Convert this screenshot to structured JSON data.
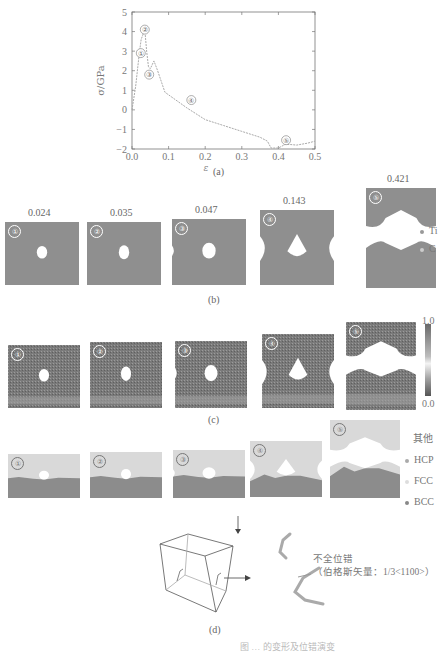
{
  "figure": {
    "panel_a": {
      "caption": "(a)"
    },
    "panel_b": {
      "caption": "(b)",
      "strains": [
        "0.024",
        "0.035",
        "0.047",
        "0.143",
        "0.421"
      ],
      "labels": [
        "①",
        "②",
        "③",
        "④",
        "⑤"
      ],
      "legend": [
        {
          "label": "Ti",
          "color": "#9a9a9a"
        },
        {
          "label": "C",
          "color": "#c8c8c8"
        }
      ]
    },
    "panel_c": {
      "caption": "(c)",
      "labels": [
        "①",
        "②",
        "③",
        "④",
        "⑤"
      ],
      "colorbar": {
        "max": "1.0",
        "min": "0.0"
      }
    },
    "panel_d": {
      "caption": "(d)",
      "labels": [
        "①",
        "②",
        "③",
        "④",
        "⑤"
      ],
      "legend": [
        {
          "label": "其他",
          "color": null
        },
        {
          "label": "HCP",
          "color": "#b0b0b0"
        },
        {
          "label": "FCC",
          "color": "#d8d8d8"
        },
        {
          "label": "BCC",
          "color": "#8a8a8a"
        }
      ],
      "annotation_line1": "不全位错",
      "annotation_line2": "（伯格斯矢量：1/3<1100>）",
      "annotation_bar_char": "1"
    },
    "bottom_cut_text": "图 … 的变形及位错演变"
  },
  "chart_data": {
    "type": "line",
    "title": "",
    "xlabel": "ε",
    "ylabel": "σ/GPa",
    "xlim": [
      0.0,
      0.5
    ],
    "ylim": [
      -2,
      5
    ],
    "xticks": [
      "0.0",
      "0.1",
      "0.2",
      "0.3",
      "0.4",
      "0.5"
    ],
    "yticks": [
      "5",
      "4",
      "3",
      "2",
      "1",
      "0",
      "-1",
      "-2"
    ],
    "grid": false,
    "series": [
      {
        "name": "stress-strain",
        "x": [
          0.0,
          0.01,
          0.02,
          0.025,
          0.035,
          0.04,
          0.045,
          0.05,
          0.06,
          0.07,
          0.09,
          0.12,
          0.15,
          0.2,
          0.25,
          0.3,
          0.35,
          0.37,
          0.38,
          0.4,
          0.42,
          0.45,
          0.48,
          0.5
        ],
        "y": [
          0.0,
          1.2,
          2.9,
          3.6,
          4.1,
          3.0,
          2.2,
          2.1,
          2.5,
          2.0,
          0.9,
          0.5,
          0.1,
          -0.5,
          -0.8,
          -1.1,
          -1.4,
          -1.6,
          -1.95,
          -1.95,
          -1.75,
          -1.8,
          -1.7,
          -1.6
        ]
      }
    ],
    "annotations": [
      {
        "label": "①",
        "x": 0.024,
        "y": 2.9
      },
      {
        "label": "②",
        "x": 0.035,
        "y": 4.1
      },
      {
        "label": "③",
        "x": 0.047,
        "y": 1.8
      },
      {
        "label": "④",
        "x": 0.143,
        "y": 0.5
      },
      {
        "label": "⑤",
        "x": 0.421,
        "y": -1.55
      }
    ]
  }
}
